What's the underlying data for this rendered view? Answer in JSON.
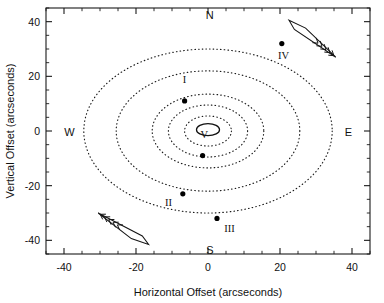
{
  "chart_data": {
    "type": "scatter",
    "title": "",
    "xlabel": "Horizontal Offset (arcseconds)",
    "ylabel": "Vertical Offset (arcseconds)",
    "xlim": [
      -45,
      45
    ],
    "ylim": [
      45,
      -45
    ],
    "y_axis_inverted": true,
    "grid": false,
    "legend": null,
    "xticks": [
      -40,
      -20,
      0,
      20,
      40
    ],
    "xticklabels": [
      "-40",
      "-20",
      "0",
      "20",
      "40"
    ],
    "yticks": [
      -40,
      -20,
      0,
      20,
      40
    ],
    "yticklabels": [
      "-40",
      "-20",
      "0",
      "20",
      "40"
    ],
    "x_minor_tick_interval": 5,
    "y_minor_tick_interval": 5,
    "points": [
      {
        "label": "I",
        "x": -6.5,
        "y": 11.0,
        "label_dx": 0.0,
        "label_dy": 6.5
      },
      {
        "label": "II",
        "x": -7.0,
        "y": -23.0,
        "label_dx": -4.0,
        "label_dy": -4.5
      },
      {
        "label": "III",
        "x": 2.5,
        "y": -32.0,
        "label_dx": 3.5,
        "label_dy": -5.0
      },
      {
        "label": "IV",
        "x": 20.5,
        "y": 32.0,
        "label_dx": 0.5,
        "label_dy": -5.5
      },
      {
        "label": "V",
        "x": -1.5,
        "y": -9.0,
        "label_dx": 0.5,
        "label_dy": 6.5
      }
    ],
    "rings": [
      {
        "rx": 6.5,
        "ry": 5.5
      },
      {
        "rx": 11.0,
        "ry": 9.5
      },
      {
        "rx": 15.5,
        "ry": 13.5
      },
      {
        "rx": 25.5,
        "ry": 22.0
      },
      {
        "rx": 34.5,
        "ry": 30.0
      }
    ],
    "ring_center": {
      "x": 0.0,
      "y": 0.0
    },
    "core_ellipse": {
      "cx": 0.0,
      "cy": 0.5,
      "rx": 3.2,
      "ry": 2.2
    },
    "compass_labels": [
      {
        "text": "S",
        "x": 0.5,
        "y": -43.5
      },
      {
        "text": "N",
        "x": 0.5,
        "y": 42.5
      },
      {
        "text": "W",
        "x": -38.5,
        "y": -0.5
      },
      {
        "text": "E",
        "x": 39.0,
        "y": -0.5
      }
    ],
    "arrows": [
      {
        "name": "upper-left-arrow",
        "tail_x": -30.5,
        "tail_y": -30.0,
        "tip_x": -16.5,
        "tip_y": -41.5,
        "barb_count": 5
      },
      {
        "name": "lower-right-arrow",
        "tail_x": 35.5,
        "tail_y": 27.0,
        "tip_x": 22.5,
        "tip_y": 40.5,
        "barb_count": 5
      }
    ]
  },
  "axes": {
    "xlabel": "Horizontal Offset (arcseconds)",
    "ylabel": "Vertical Offset (arcseconds)"
  }
}
